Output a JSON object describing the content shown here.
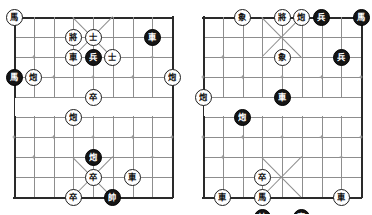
{
  "page": {
    "board_count": 2,
    "files": 9,
    "ranks": 10
  },
  "colors": {
    "page_background": "#ffffff",
    "grid_line": "#8d8d8d",
    "border_line": "#2a2a2a",
    "star_point": "#9a9a9a",
    "light_piece_fill": "#ffffff",
    "light_piece_text": "#111111",
    "dark_piece_fill": "#151515",
    "dark_piece_text": "#ffffff"
  },
  "boards": [
    {
      "id": "board-left",
      "label": "left-board",
      "x": 14,
      "y": 17,
      "width": 158,
      "height": 180,
      "pieces": [
        {
          "glyph": "馬",
          "side": "light",
          "file": 0,
          "rank": 0
        },
        {
          "glyph": "將",
          "side": "light",
          "file": 3,
          "rank": 1
        },
        {
          "glyph": "士",
          "side": "light",
          "file": 4,
          "rank": 1
        },
        {
          "glyph": "車",
          "side": "dark",
          "file": 7,
          "rank": 1
        },
        {
          "glyph": "車",
          "side": "light",
          "file": 3,
          "rank": 2
        },
        {
          "glyph": "兵",
          "side": "dark",
          "file": 4,
          "rank": 2
        },
        {
          "glyph": "士",
          "side": "light",
          "file": 5,
          "rank": 2
        },
        {
          "glyph": "馬",
          "side": "dark",
          "file": 0,
          "rank": 3
        },
        {
          "glyph": "炮",
          "side": "light",
          "file": 1,
          "rank": 3
        },
        {
          "glyph": "炮",
          "side": "light",
          "file": 8,
          "rank": 3
        },
        {
          "glyph": "卒",
          "side": "light",
          "file": 4,
          "rank": 4
        },
        {
          "glyph": "炮",
          "side": "light",
          "file": 3,
          "rank": 5
        },
        {
          "glyph": "炮",
          "side": "dark",
          "file": 4,
          "rank": 7
        },
        {
          "glyph": "卒",
          "side": "light",
          "file": 4,
          "rank": 8
        },
        {
          "glyph": "車",
          "side": "light",
          "file": 6,
          "rank": 8
        },
        {
          "glyph": "卒",
          "side": "light",
          "file": 3,
          "rank": 9
        },
        {
          "glyph": "帥",
          "side": "dark",
          "file": 5,
          "rank": 9
        }
      ]
    },
    {
      "id": "board-right",
      "label": "right-board",
      "x": 203,
      "y": 17,
      "width": 158,
      "height": 180,
      "pieces": [
        {
          "glyph": "象",
          "side": "light",
          "file": 2,
          "rank": 0
        },
        {
          "glyph": "將",
          "side": "light",
          "file": 4,
          "rank": 0
        },
        {
          "glyph": "炮",
          "side": "light",
          "file": 5,
          "rank": 0
        },
        {
          "glyph": "兵",
          "side": "dark",
          "file": 6,
          "rank": 0
        },
        {
          "glyph": "馬",
          "side": "dark",
          "file": 8,
          "rank": 0
        },
        {
          "glyph": "象",
          "side": "light",
          "file": 4,
          "rank": 2
        },
        {
          "glyph": "兵",
          "side": "dark",
          "file": 7,
          "rank": 2
        },
        {
          "glyph": "車",
          "side": "dark",
          "file": 4,
          "rank": 4
        },
        {
          "glyph": "炮",
          "side": "light",
          "file": 0,
          "rank": 4
        },
        {
          "glyph": "炮",
          "side": "dark",
          "file": 2,
          "rank": 5
        },
        {
          "glyph": "卒",
          "side": "light",
          "file": 3,
          "rank": 8
        },
        {
          "glyph": "馬",
          "side": "light",
          "file": 3,
          "rank": 9
        },
        {
          "glyph": "車",
          "side": "light",
          "file": 1,
          "rank": 9
        },
        {
          "glyph": "車",
          "side": "light",
          "file": 7,
          "rank": 9
        },
        {
          "glyph": "帥",
          "side": "dark",
          "file": 3,
          "rank": 10
        },
        {
          "glyph": "車",
          "side": "dark",
          "file": 5,
          "rank": 10
        }
      ]
    }
  ]
}
